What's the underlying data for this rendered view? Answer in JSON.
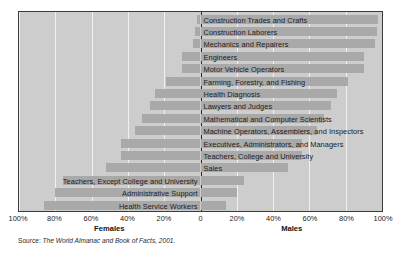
{
  "chart_data": {
    "type": "bar",
    "subtype": "diverging-horizontal-bar",
    "title": "",
    "xlabel": "",
    "ylabel": "",
    "grid": true,
    "legend": false,
    "axis_left_label": "Females",
    "axis_right_label": "Males",
    "xlim": [
      -100,
      100
    ],
    "tick_labels": [
      "100%",
      "80%",
      "60%",
      "40%",
      "20%",
      "0",
      "20%",
      "40%",
      "60%",
      "80%",
      "100%"
    ],
    "tick_values": [
      -100,
      -80,
      -60,
      -40,
      -20,
      0,
      20,
      40,
      60,
      80,
      100
    ],
    "series": [
      {
        "name": "Females",
        "values": [
          2,
          3,
          4,
          10,
          10,
          19,
          25,
          28,
          32,
          36,
          44,
          44,
          52,
          76,
          80,
          86
        ]
      },
      {
        "name": "Males",
        "values": [
          98,
          97,
          96,
          90,
          90,
          81,
          75,
          72,
          68,
          64,
          56,
          56,
          48,
          24,
          20,
          14
        ]
      }
    ],
    "categories": [
      "Construction Trades and Crafts",
      "Construction Laborers",
      "Mechanics and Repairers",
      "Engineers",
      "Motor Vehicle Operators",
      "Farming, Forestry, and Fishing",
      "Health Diagnosis",
      "Lawyers and Judges",
      "Mathematical and Computer Scientists",
      "Machine Operators, Assemblers, and Inspectors",
      "Executives, Administrators, and Managers",
      "Teachers, College and University",
      "Sales",
      "Teachers, Except College and University",
      "Administrative Support",
      "Health Service Workers"
    ],
    "label_side": [
      "right",
      "right",
      "right",
      "right",
      "right",
      "right",
      "right",
      "right",
      "right",
      "right",
      "right",
      "right",
      "right",
      "left",
      "left",
      "left"
    ],
    "colors": {
      "bar": "#a9a9a9",
      "plot_background": "#cdcdcd",
      "page_background": "#ffffff",
      "axis": "#2a2a2a",
      "gridline": "#f0f0f0",
      "border": "#3a3a3a"
    }
  },
  "source": {
    "label": "Source: ",
    "text": "The World Almanac and Book of Facts, 2001."
  }
}
